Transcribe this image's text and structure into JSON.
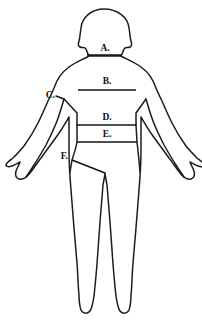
{
  "diagram": {
    "stroke_color": "#1c1c1c",
    "line_color": "#141414",
    "background_color": "#ffffff",
    "fill_color": "#ffffff",
    "labels": [
      {
        "id": "A",
        "text": "A.",
        "part": "neck",
        "label_x": 105,
        "label_y": 51,
        "anchor": "mid",
        "line": {
          "x1": 87,
          "y1": 55,
          "x2": 122,
          "y2": 55
        },
        "leader": null
      },
      {
        "id": "B",
        "text": "B.",
        "part": "chest",
        "label_x": 107,
        "label_y": 84,
        "anchor": "mid",
        "line": {
          "x1": 78,
          "y1": 90,
          "x2": 136,
          "y2": 90
        },
        "leader": null
      },
      {
        "id": "C",
        "text": "C.",
        "part": "shoulder-to-armpit",
        "label_x": 55,
        "label_y": 98,
        "anchor": "end",
        "line": null,
        "leader": {
          "x1": 56,
          "y1": 96,
          "x2": 64,
          "y2": 99
        }
      },
      {
        "id": "D",
        "text": "D.",
        "part": "waist",
        "label_x": 107,
        "label_y": 120,
        "anchor": "mid",
        "line": {
          "x1": 77,
          "y1": 125,
          "x2": 136,
          "y2": 125
        },
        "leader": null
      },
      {
        "id": "E",
        "text": "E.",
        "part": "hip",
        "label_x": 107,
        "label_y": 137,
        "anchor": "mid",
        "line": {
          "x1": 77,
          "y1": 142,
          "x2": 137,
          "y2": 142
        },
        "leader": null
      },
      {
        "id": "F",
        "text": "F.",
        "part": "rise-inseam",
        "label_x": 68,
        "label_y": 159,
        "anchor": "end",
        "line": {
          "x1": 72,
          "y1": 160,
          "x2": 105,
          "y2": 173
        },
        "leader": null
      }
    ]
  }
}
